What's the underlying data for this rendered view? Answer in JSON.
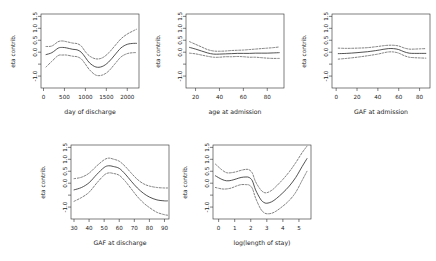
{
  "figure": {
    "kind": "gam-partial-effect-panels",
    "rows": 2,
    "cols": 3,
    "y_axis_label": "eta contrib.",
    "y_ticks": [
      "1.5",
      "1.0",
      "0.5",
      "0.0",
      "-1.0"
    ],
    "y_tick_values": [
      1.5,
      1.0,
      0.5,
      0.0,
      -1.0
    ],
    "y_minor_tick_values": [
      -0.5
    ],
    "ylim": [
      -1.5,
      1.6
    ],
    "line_styles": {
      "fit": "solid",
      "confidence_band": "dashed"
    },
    "colors": {
      "fit": "#333333",
      "confidence_band": "#555555",
      "axis": "#2b2b2b",
      "background": "#ffffff"
    }
  },
  "chart_data": [
    {
      "type": "line",
      "panel_index": 0,
      "title": "",
      "xlabel": "day of discharge",
      "ylabel": "eta contrib.",
      "xlim": [
        -60,
        2280
      ],
      "ylim": [
        -1.5,
        1.6
      ],
      "xticks": [
        0,
        500,
        1000,
        1500,
        2000
      ],
      "xtick_labels": [
        "0",
        "500",
        "1000",
        "1500",
        "2000"
      ],
      "yticks": [
        1.5,
        1.0,
        0.5,
        0.0,
        -1.0
      ],
      "ytick_labels": [
        "1.5",
        "1.0",
        "0.5",
        "0.0",
        "-1.0"
      ],
      "grid": false,
      "legend": "none",
      "x": [
        60,
        200,
        350,
        450,
        550,
        700,
        800,
        900,
        1000,
        1100,
        1250,
        1400,
        1550,
        1700,
        1850,
        2000,
        2150,
        2220
      ],
      "series": [
        {
          "name": "fit",
          "style": "solid",
          "values": [
            -0.1,
            -0.02,
            0.17,
            0.2,
            0.18,
            0.12,
            0.1,
            0.0,
            -0.22,
            -0.45,
            -0.62,
            -0.6,
            -0.42,
            -0.12,
            0.18,
            0.33,
            0.37,
            0.37
          ]
        },
        {
          "name": "upper 95% CI",
          "style": "dashed",
          "values": [
            0.24,
            0.26,
            0.44,
            0.47,
            0.44,
            0.38,
            0.36,
            0.26,
            0.02,
            -0.16,
            -0.28,
            -0.24,
            -0.04,
            0.26,
            0.56,
            0.76,
            0.9,
            0.96
          ]
        },
        {
          "name": "lower 95% CI",
          "style": "dashed",
          "values": [
            -0.62,
            -0.38,
            -0.14,
            -0.12,
            -0.12,
            -0.17,
            -0.19,
            -0.28,
            -0.5,
            -0.74,
            -0.96,
            -0.96,
            -0.8,
            -0.5,
            -0.2,
            -0.06,
            -0.02,
            -0.02
          ]
        }
      ]
    },
    {
      "type": "line",
      "panel_index": 1,
      "title": "",
      "xlabel": "age at admission",
      "ylabel": "eta contrib.",
      "xlim": [
        12,
        94
      ],
      "ylim": [
        -1.5,
        1.6
      ],
      "xticks": [
        20,
        40,
        60,
        80
      ],
      "xtick_labels": [
        "20",
        "40",
        "60",
        "80"
      ],
      "yticks": [
        1.5,
        1.0,
        0.5,
        0.0,
        -1.0
      ],
      "ytick_labels": [
        "1.5",
        "1.0",
        "0.5",
        "0.0",
        "-1.0"
      ],
      "grid": false,
      "legend": "none",
      "x": [
        15,
        20,
        25,
        30,
        35,
        40,
        45,
        50,
        55,
        60,
        65,
        70,
        75,
        80,
        85,
        90
      ],
      "series": [
        {
          "name": "fit",
          "style": "solid",
          "values": [
            0.2,
            0.13,
            0.05,
            -0.03,
            -0.08,
            -0.08,
            -0.07,
            -0.06,
            -0.05,
            -0.05,
            -0.05,
            -0.04,
            -0.04,
            -0.04,
            -0.03,
            -0.02
          ]
        },
        {
          "name": "upper 95% CI",
          "style": "dashed",
          "values": [
            0.44,
            0.33,
            0.22,
            0.11,
            0.05,
            0.04,
            0.05,
            0.07,
            0.08,
            0.09,
            0.11,
            0.13,
            0.15,
            0.17,
            0.19,
            0.22
          ]
        },
        {
          "name": "lower 95% CI",
          "style": "dashed",
          "values": [
            -0.04,
            -0.07,
            -0.12,
            -0.17,
            -0.21,
            -0.21,
            -0.19,
            -0.19,
            -0.18,
            -0.19,
            -0.21,
            -0.21,
            -0.23,
            -0.25,
            -0.26,
            -0.26
          ]
        }
      ]
    },
    {
      "type": "line",
      "panel_index": 2,
      "title": "",
      "xlabel": "GAF at admission",
      "ylabel": "eta contrib.",
      "xlim": [
        -4,
        90
      ],
      "ylim": [
        -1.5,
        1.6
      ],
      "xticks": [
        0,
        20,
        40,
        60,
        80
      ],
      "xtick_labels": [
        "0",
        "20",
        "40",
        "60",
        "80"
      ],
      "yticks": [
        1.5,
        1.0,
        0.5,
        0.0,
        -1.0
      ],
      "ytick_labels": [
        "1.5",
        "1.0",
        "0.5",
        "0.0",
        "-1.0"
      ],
      "grid": false,
      "legend": "none",
      "x": [
        2,
        10,
        20,
        30,
        40,
        45,
        50,
        55,
        60,
        65,
        70,
        75,
        80,
        86
      ],
      "series": [
        {
          "name": "fit",
          "style": "solid",
          "values": [
            -0.06,
            -0.05,
            -0.02,
            0.02,
            0.08,
            0.12,
            0.15,
            0.15,
            0.11,
            0.02,
            -0.04,
            -0.05,
            -0.05,
            -0.05
          ]
        },
        {
          "name": "upper 95% CI",
          "style": "dashed",
          "values": [
            0.17,
            0.16,
            0.17,
            0.19,
            0.24,
            0.27,
            0.29,
            0.29,
            0.26,
            0.18,
            0.13,
            0.13,
            0.14,
            0.15
          ]
        },
        {
          "name": "lower 95% CI",
          "style": "dashed",
          "values": [
            -0.29,
            -0.26,
            -0.21,
            -0.15,
            -0.08,
            -0.03,
            0.01,
            0.01,
            -0.04,
            -0.14,
            -0.21,
            -0.23,
            -0.24,
            -0.25
          ]
        }
      ]
    },
    {
      "type": "line",
      "panel_index": 3,
      "title": "",
      "xlabel": "GAF at discharge",
      "ylabel": "eta contrib.",
      "xlim": [
        28,
        93
      ],
      "ylim": [
        -1.5,
        1.6
      ],
      "xticks": [
        30,
        40,
        50,
        60,
        70,
        80,
        90
      ],
      "xtick_labels": [
        "30",
        "40",
        "50",
        "60",
        "70",
        "80",
        "90"
      ],
      "yticks": [
        1.5,
        1.0,
        0.5,
        0.0,
        -1.0
      ],
      "ytick_labels": [
        "1.5",
        "1.0",
        "0.5",
        "0.0",
        "-1.0"
      ],
      "grid": false,
      "legend": "none",
      "x": [
        30,
        35,
        40,
        45,
        50,
        53,
        56,
        60,
        64,
        68,
        72,
        76,
        80,
        85,
        90,
        92
      ],
      "series": [
        {
          "name": "fit",
          "style": "solid",
          "values": [
            -0.28,
            -0.18,
            0.02,
            0.36,
            0.66,
            0.73,
            0.7,
            0.62,
            0.38,
            0.08,
            -0.2,
            -0.42,
            -0.58,
            -0.7,
            -0.74,
            -0.74
          ]
        },
        {
          "name": "upper 95% CI",
          "style": "dashed",
          "values": [
            0.19,
            0.25,
            0.42,
            0.72,
            0.98,
            1.05,
            1.01,
            0.92,
            0.7,
            0.42,
            0.16,
            -0.02,
            -0.12,
            -0.18,
            -0.2,
            -0.2
          ]
        },
        {
          "name": "lower 95% CI",
          "style": "dashed",
          "values": [
            -0.76,
            -0.6,
            -0.38,
            0.0,
            0.34,
            0.43,
            0.41,
            0.33,
            0.08,
            -0.24,
            -0.56,
            -0.82,
            -1.02,
            -1.22,
            -1.32,
            -1.34
          ]
        }
      ]
    },
    {
      "type": "line",
      "panel_index": 4,
      "title": "",
      "xlabel": "log(length of stay)",
      "ylabel": "eta contrib.",
      "xlim": [
        -0.35,
        5.75
      ],
      "ylim": [
        -1.5,
        1.6
      ],
      "xticks": [
        0,
        1,
        2,
        3,
        4,
        5
      ],
      "xtick_labels": [
        "0",
        "1",
        "2",
        "3",
        "4",
        "5"
      ],
      "yticks": [
        1.5,
        1.0,
        0.5,
        0.0,
        -1.0
      ],
      "ytick_labels": [
        "1.5",
        "1.0",
        "0.5",
        "0.0",
        "-1.0"
      ],
      "grid": false,
      "legend": "none",
      "x": [
        -0.2,
        0.2,
        0.5,
        0.8,
        1.1,
        1.4,
        1.7,
        1.9,
        2.1,
        2.3,
        2.6,
        2.8,
        3.0,
        3.3,
        3.6,
        4.0,
        4.4,
        4.8,
        5.2,
        5.5
      ],
      "series": [
        {
          "name": "fit",
          "style": "solid",
          "values": [
            0.31,
            0.16,
            0.1,
            0.12,
            0.18,
            0.24,
            0.26,
            0.24,
            0.1,
            -0.28,
            -0.66,
            -0.8,
            -0.84,
            -0.78,
            -0.64,
            -0.4,
            -0.12,
            0.24,
            0.7,
            1.03
          ]
        },
        {
          "name": "upper 95% CI",
          "style": "dashed",
          "values": [
            0.8,
            0.56,
            0.44,
            0.44,
            0.48,
            0.54,
            0.58,
            0.56,
            0.42,
            0.06,
            -0.26,
            -0.38,
            -0.4,
            -0.3,
            -0.12,
            0.16,
            0.48,
            0.86,
            1.28,
            1.55
          ]
        },
        {
          "name": "lower 95% CI",
          "style": "dashed",
          "values": [
            -0.18,
            -0.24,
            -0.24,
            -0.2,
            -0.12,
            -0.06,
            -0.06,
            -0.08,
            -0.22,
            -0.62,
            -1.06,
            -1.22,
            -1.28,
            -1.26,
            -1.16,
            -0.96,
            -0.72,
            -0.38,
            0.12,
            0.5
          ]
        }
      ]
    }
  ]
}
